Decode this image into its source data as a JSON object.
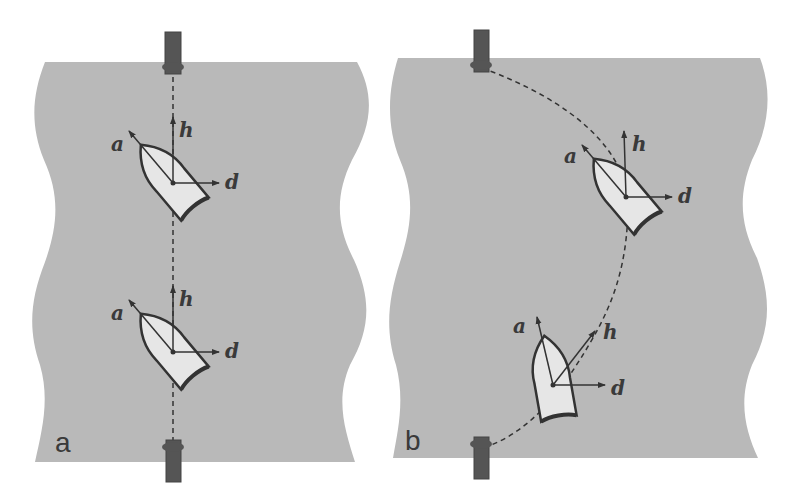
{
  "colors": {
    "water": "#b9b9b9",
    "boat_fill": "#e6e6e6",
    "stroke": "#333333",
    "pier": "#555555",
    "background": "#ffffff"
  },
  "panels": [
    {
      "label": "a",
      "description": "Boat crossing heading upstream-angled; straight path between piers",
      "boats": [
        {
          "vectors": {
            "a": "a",
            "h": "h",
            "d": "d"
          }
        },
        {
          "vectors": {
            "a": "a",
            "h": "h",
            "d": "d"
          }
        }
      ]
    },
    {
      "label": "b",
      "description": "Boat drifting along curved path between piers",
      "boats": [
        {
          "vectors": {
            "a": "a",
            "h": "h",
            "d": "d"
          }
        },
        {
          "vectors": {
            "a": "a",
            "h": "h",
            "d": "d"
          }
        }
      ]
    }
  ],
  "vector_labels": {
    "a": "a",
    "h": "h",
    "d": "d"
  }
}
